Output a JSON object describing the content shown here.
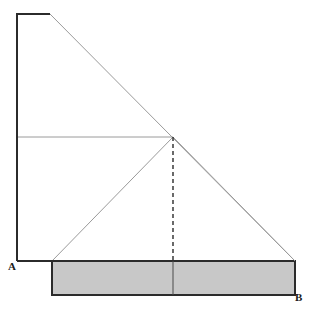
{
  "figure": {
    "width": 312,
    "height": 314,
    "background_color": "#ffffff"
  },
  "labels": {
    "point_a": "A",
    "point_b": "B"
  },
  "colors": {
    "outline_dark": "#2b2b2b",
    "construction_line": "#9a9a9a",
    "shaded_fill": "#c8c8c8",
    "shaded_border": "#2b2b2b",
    "dashed_line": "#2b2b2b",
    "label_text": "#1a1a1a"
  },
  "strokes": {
    "outline_width": 2,
    "construction_width": 1,
    "shaded_border_width": 2,
    "divider_width": 1,
    "dashed_width": 1.4,
    "dash_pattern": "4,3"
  },
  "geometry": {
    "left_wall": {
      "x1": 17,
      "y1": 14,
      "x2": 17,
      "y2": 261
    },
    "top_edge": {
      "x1": 17,
      "y1": 14,
      "x2": 50,
      "y2": 14
    },
    "hypotenuse": {
      "x1": 50,
      "y1": 14,
      "x2": 295,
      "y2": 261
    },
    "mid_horizontal": {
      "x1": 17,
      "y1": 137,
      "x2": 173,
      "y2": 137
    },
    "left_diagonal": {
      "x1": 52,
      "y1": 261,
      "x2": 173,
      "y2": 137
    },
    "right_diagonal": {
      "x1": 173,
      "y1": 137,
      "x2": 295,
      "y2": 261
    },
    "dashed_drop": {
      "x1": 173,
      "y1": 137,
      "x2": 173,
      "y2": 261
    },
    "base_line": {
      "x1": 17,
      "y1": 261,
      "x2": 295,
      "y2": 261
    },
    "apex_point": {
      "x": 173,
      "y": 137
    },
    "shaded_rect": {
      "x": 52,
      "y": 261,
      "width": 243,
      "height": 34
    },
    "rect_divider": {
      "x1": 173,
      "y1": 261,
      "x2": 173,
      "y2": 295
    }
  },
  "chart_data": {
    "type": "diagram",
    "points": [
      {
        "name": "A",
        "x": 17,
        "y": 261,
        "labeled": true
      },
      {
        "name": "B",
        "x": 295,
        "y": 295,
        "labeled": true
      },
      {
        "name": "apex",
        "x": 173,
        "y": 137,
        "labeled": false
      },
      {
        "name": "top-left",
        "x": 17,
        "y": 14,
        "labeled": false
      },
      {
        "name": "top-bend",
        "x": 50,
        "y": 14,
        "labeled": false
      },
      {
        "name": "rect-top-left",
        "x": 52,
        "y": 261,
        "labeled": false
      },
      {
        "name": "rect-top-right",
        "x": 295,
        "y": 261,
        "labeled": false
      }
    ],
    "segments": [
      {
        "name": "left-wall",
        "style": "solid-dark"
      },
      {
        "name": "top-edge",
        "style": "solid-dark"
      },
      {
        "name": "hypotenuse",
        "style": "solid-thin"
      },
      {
        "name": "mid-horizontal",
        "style": "solid-thin"
      },
      {
        "name": "left-diagonal",
        "style": "solid-thin"
      },
      {
        "name": "right-diagonal",
        "style": "solid-thin"
      },
      {
        "name": "dashed-drop",
        "style": "dashed"
      },
      {
        "name": "base-line",
        "style": "solid-dark"
      },
      {
        "name": "rect-divider",
        "style": "solid-thin"
      }
    ],
    "regions": [
      {
        "name": "shaded-base-rectangle",
        "fill": "#c8c8c8"
      }
    ]
  }
}
